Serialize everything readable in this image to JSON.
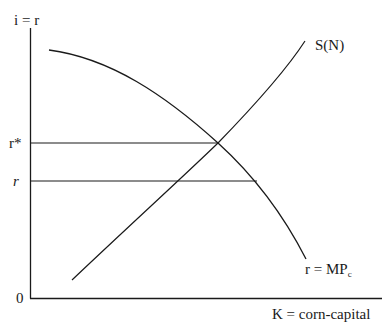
{
  "diagram": {
    "y_axis_label": "i = r",
    "x_axis_label": "K = corn-capital",
    "origin_label": "0",
    "y_ticks": [
      {
        "label": "r*",
        "italic": false
      },
      {
        "label": "r",
        "italic": true
      }
    ],
    "curves": [
      {
        "name": "supply",
        "label": "S(N)",
        "shape": "upward-sloping line"
      },
      {
        "name": "marginal-product",
        "label_main": "r = MP",
        "label_sub": "c",
        "shape": "downward-sloping concave curve"
      }
    ],
    "line_color": "#1a1a1a"
  }
}
